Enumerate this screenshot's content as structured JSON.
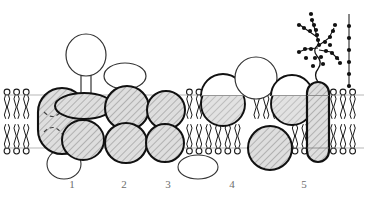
{
  "figure": {
    "subtitle": "Phospholipid bilayer with integral and peripheral proteins",
    "background_color": "#ffffff",
    "line_color": "#1a1a1a",
    "protein_fill": "#d8d8d8",
    "hatch_color": "#6e6e6e",
    "label_color": "#6d6d6d",
    "lipid_head_fill": "#ffffff",
    "glycan_color": "#111111"
  },
  "membrane": {
    "name": "phospholipid-bilayer",
    "upper_leaflet_y": 95,
    "lower_leaflet_y": 148,
    "left_edge_x": 4,
    "right_edge_x": 364,
    "leaflet_count": 2,
    "lipid_head_shape": "open-circle",
    "lipid_tail_shape": "wavy-double-tail"
  },
  "labels": [
    {
      "id": "label-1",
      "text": "1",
      "x": 72,
      "y": 184,
      "describes": "integral-protein-transmembrane-capsule-with-internal-channel"
    },
    {
      "id": "label-2",
      "text": "2",
      "x": 124,
      "y": 184,
      "describes": "integral-protein-two-lobes-with-extracellular-ellipse"
    },
    {
      "id": "label-3",
      "text": "3",
      "x": 168,
      "y": 184,
      "describes": "integral-protein-two-lobes-with-intracellular-ellipse"
    },
    {
      "id": "label-4",
      "text": "4",
      "x": 232,
      "y": 184,
      "describes": "monolayer-embedded-proteins-and-surface-protein"
    },
    {
      "id": "label-5",
      "text": "5",
      "x": 304,
      "y": 184,
      "describes": "glycoprotein-with-branched-oligosaccharide"
    }
  ],
  "proteins": [
    {
      "name": "protein-1-transmembrane-capsule",
      "group": "1",
      "shape": "rounded-capsule-vertical",
      "cx": 62,
      "cy": 121,
      "rx": 24,
      "ry": 33,
      "fill": "hatched",
      "spans_membrane": true,
      "internal_detail": "dashed-channel-lines"
    },
    {
      "name": "protein-1-peripheral-circle-inner",
      "group": "1",
      "shape": "open-circle",
      "cx": 64,
      "cy": 164,
      "rx": 17,
      "ry": 15,
      "fill": "none",
      "spans_membrane": false,
      "side": "intracellular"
    },
    {
      "name": "protein-2-extracellular-stalk-head",
      "group": "2",
      "shape": "lollipop-circle-on-stalk",
      "cx": 86,
      "cy": 55,
      "rx": 20,
      "ry": 21,
      "fill": "none",
      "stalk_width": 9,
      "side": "extracellular"
    },
    {
      "name": "protein-2-upper-lobe",
      "group": "2",
      "shape": "ellipse-horizontal",
      "cx": 84,
      "cy": 105,
      "rx": 29,
      "ry": 13,
      "fill": "hatched",
      "spans_membrane": false
    },
    {
      "name": "protein-2-lower-lobe",
      "group": "2",
      "shape": "circle",
      "cx": 83,
      "cy": 140,
      "rx": 21,
      "ry": 20,
      "fill": "hatched",
      "spans_membrane": false
    },
    {
      "name": "protein-3-extracellular-ellipse",
      "group": "3",
      "shape": "ellipse-horizontal",
      "cx": 125,
      "cy": 76,
      "rx": 21,
      "ry": 13,
      "fill": "none",
      "side": "extracellular"
    },
    {
      "name": "protein-3-upper-lobe",
      "group": "3",
      "shape": "circle",
      "cx": 127,
      "cy": 107,
      "rx": 22,
      "ry": 22,
      "fill": "hatched",
      "spans_membrane": true
    },
    {
      "name": "protein-3-lower-lobe",
      "group": "3",
      "shape": "circle",
      "cx": 126,
      "cy": 143,
      "rx": 21,
      "ry": 20,
      "fill": "hatched",
      "spans_membrane": true
    },
    {
      "name": "protein-4-upper-lobe",
      "group": "4",
      "shape": "circle",
      "cx": 166,
      "cy": 110,
      "rx": 19,
      "ry": 19,
      "fill": "hatched",
      "spans_membrane": true
    },
    {
      "name": "protein-4-lower-lobe",
      "group": "4",
      "shape": "circle",
      "cx": 165,
      "cy": 143,
      "rx": 19,
      "ry": 19,
      "fill": "hatched",
      "spans_membrane": true
    },
    {
      "name": "protein-4-intracellular-ellipse",
      "group": "4",
      "shape": "ellipse-horizontal",
      "cx": 198,
      "cy": 167,
      "rx": 20,
      "ry": 12,
      "fill": "none",
      "side": "intracellular"
    },
    {
      "name": "protein-5-outer-leaflet-circle",
      "group": "4",
      "shape": "circle",
      "cx": 223,
      "cy": 104,
      "rx": 22,
      "ry": 22,
      "fill": "hatched-lower-half",
      "spans_membrane": false,
      "side": "outer-leaflet"
    },
    {
      "name": "protein-5-surface-circle",
      "group": "4",
      "shape": "open-circle",
      "cx": 256,
      "cy": 78,
      "rx": 21,
      "ry": 21,
      "fill": "none",
      "side": "extracellular"
    },
    {
      "name": "protein-6-inner-leaflet-circle",
      "group": "4",
      "shape": "circle",
      "cx": 270,
      "cy": 148,
      "rx": 22,
      "ry": 22,
      "fill": "hatched",
      "spans_membrane": false,
      "side": "inner-leaflet"
    },
    {
      "name": "protein-7-outer-leaflet-circle",
      "group": "5",
      "shape": "circle",
      "cx": 292,
      "cy": 104,
      "rx": 21,
      "ry": 21,
      "fill": "hatched-lower-half",
      "spans_membrane": false,
      "side": "outer-leaflet"
    },
    {
      "name": "protein-8-glycoprotein-capsule",
      "group": "5",
      "shape": "narrow-capsule-vertical",
      "cx": 318,
      "cy": 121,
      "rx": 11,
      "ry": 40,
      "fill": "hatched",
      "spans_membrane": true,
      "has_glycan": true
    }
  ],
  "glycans": [
    {
      "name": "branched-oligosaccharide-chain",
      "attached_to": "protein-8-glycoprotein-capsule",
      "style": "filled-dots-on-branches",
      "dot_radius": 2.1,
      "branch_count": 4,
      "dot_count": 27
    },
    {
      "name": "linear-oligosaccharide-chain",
      "attached_to": "membrane-lipid-head",
      "style": "filled-dots-vertical",
      "dot_radius": 2.1,
      "dot_count": 6
    }
  ]
}
